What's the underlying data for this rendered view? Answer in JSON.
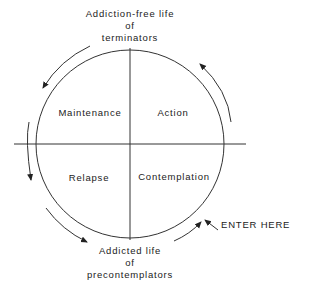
{
  "diagram": {
    "top_label": [
      "Addiction-free life",
      "of",
      "terminators"
    ],
    "bottom_label": [
      "Addicted life",
      "of",
      "precontemplators"
    ],
    "quadrants": {
      "top_left": "Maintenance",
      "top_right": "Action",
      "bottom_left": "Relapse",
      "bottom_right": "Contemplation"
    },
    "entry_label": "ENTER HERE",
    "line_color": "#333333"
  }
}
